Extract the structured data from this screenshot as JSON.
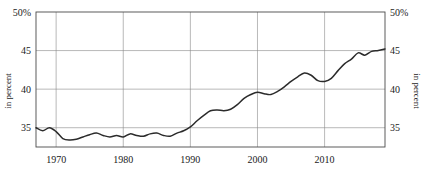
{
  "chart_data": {
    "type": "line",
    "title": "",
    "xlabel": "",
    "ylabel": "in percent",
    "ylabel_right": "in percent",
    "xlim": [
      1967,
      2019
    ],
    "ylim": [
      32.5,
      50
    ],
    "grid": true,
    "legend": false,
    "y_ticks": [
      35,
      40,
      45,
      50
    ],
    "y_tick_labels": [
      "35",
      "40",
      "45",
      "50%"
    ],
    "y_ticks_right": [
      35,
      40,
      45,
      50
    ],
    "y_tick_labels_right": [
      "35",
      "40",
      "45",
      "50%"
    ],
    "x_ticks": [
      1970,
      1980,
      1990,
      2000,
      2010
    ],
    "x_tick_labels": [
      "1970",
      "1980",
      "1990",
      "2000",
      "2010"
    ],
    "series": [
      {
        "name": "share",
        "color": "#2b2b2b",
        "x": [
          1967,
          1968,
          1969,
          1970,
          1971,
          1972,
          1973,
          1974,
          1975,
          1976,
          1977,
          1978,
          1979,
          1980,
          1981,
          1982,
          1983,
          1984,
          1985,
          1986,
          1987,
          1988,
          1989,
          1990,
          1991,
          1992,
          1993,
          1994,
          1995,
          1996,
          1997,
          1998,
          1999,
          2000,
          2001,
          2002,
          2003,
          2004,
          2005,
          2006,
          2007,
          2008,
          2009,
          2010,
          2011,
          2012,
          2013,
          2014,
          2015,
          2016,
          2017,
          2018,
          2019
        ],
        "values": [
          35.0,
          34.6,
          35.0,
          34.5,
          33.6,
          33.4,
          33.5,
          33.8,
          34.1,
          34.3,
          34.0,
          33.8,
          34.0,
          33.8,
          34.2,
          34.0,
          33.9,
          34.2,
          34.3,
          34.0,
          33.9,
          34.3,
          34.6,
          35.1,
          35.9,
          36.6,
          37.2,
          37.3,
          37.2,
          37.4,
          38.0,
          38.8,
          39.3,
          39.6,
          39.4,
          39.3,
          39.7,
          40.3,
          41.0,
          41.6,
          42.1,
          41.8,
          41.1,
          41.0,
          41.4,
          42.4,
          43.3,
          43.9,
          44.7,
          44.4,
          44.9,
          45.0,
          45.2
        ]
      }
    ]
  },
  "axes": {
    "left_title": "in percent",
    "right_title": "in percent"
  }
}
